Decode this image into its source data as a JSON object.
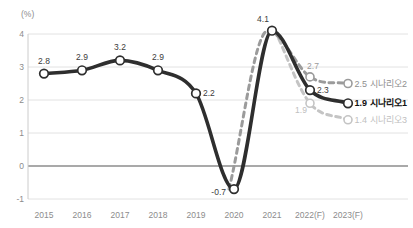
{
  "chart_data": {
    "type": "line",
    "title": "",
    "unit_label": "(%)",
    "xlabel": "",
    "ylabel": "(%)",
    "x_categories": [
      "2015",
      "2016",
      "2017",
      "2018",
      "2019",
      "2020",
      "2021",
      "2022(F)",
      "2023(F)"
    ],
    "yticks": [
      4,
      3,
      2,
      1,
      0,
      -1
    ],
    "ylim": [
      -1,
      4
    ],
    "grid": true,
    "legend_position": "right-end-of-lines",
    "palette": {
      "grid_color": "#e2e2e2",
      "zero_line_color": "#555555",
      "axis_line_color": "#cccccc",
      "tick_text_color": "#8c8c8c",
      "background": "#ffffff"
    },
    "series": [
      {
        "name": "시나리오1",
        "style": "solid",
        "color": "#2e2e2e",
        "label_color": "#3c3c3c",
        "x_index": [
          0,
          1,
          2,
          3,
          4,
          5,
          6,
          7,
          8
        ],
        "values": [
          2.8,
          2.9,
          3.2,
          2.9,
          2.2,
          -0.7,
          4.1,
          2.3,
          1.9
        ],
        "labels": [
          "2.8",
          "2.9",
          "3.2",
          "2.9",
          "2.2",
          "-0.7",
          "4.1",
          "2.3",
          null
        ],
        "end_label": {
          "value": "1.9",
          "name": "시나리오1"
        }
      },
      {
        "name": "시나리오2",
        "style": "dashed",
        "color": "#9b9b9b",
        "label_color": "#9b9b9b",
        "x_index": [
          5,
          6,
          7,
          8
        ],
        "values": [
          -0.7,
          4.1,
          2.7,
          2.5
        ],
        "labels": [
          null,
          null,
          "2.7",
          null
        ],
        "end_label": {
          "value": "2.5",
          "name": "시나리오2"
        }
      },
      {
        "name": "시나리오3",
        "style": "dashed",
        "color": "#c4c4c4",
        "label_color": "#c0c0c0",
        "x_index": [
          6,
          7,
          8
        ],
        "values": [
          4.1,
          1.9,
          1.4
        ],
        "labels": [
          null,
          "1.9",
          null
        ],
        "end_label": {
          "value": "1.4",
          "name": "시나리오3"
        }
      }
    ]
  }
}
